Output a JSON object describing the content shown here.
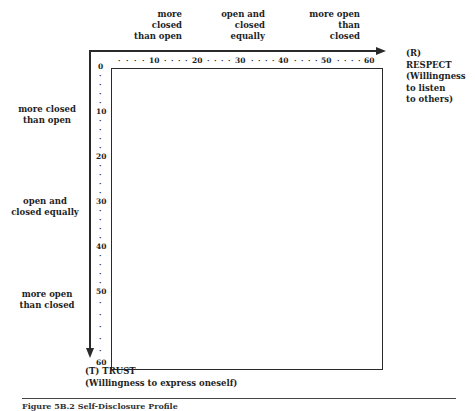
{
  "figure": {
    "top_labels": [
      {
        "lines": [
          "more",
          "closed",
          "than open"
        ]
      },
      {
        "lines": [
          "open and",
          "closed",
          "equally"
        ]
      },
      {
        "lines": [
          "more open",
          "than",
          "closed"
        ]
      }
    ],
    "left_labels": [
      {
        "lines": [
          "more closed",
          "than open"
        ]
      },
      {
        "lines": [
          "open and",
          "closed equally"
        ]
      },
      {
        "lines": [
          "more open",
          "than closed"
        ]
      }
    ],
    "x_axis": {
      "code": "(R)",
      "name": "RESPECT",
      "description_lines": [
        "(Willingness",
        "to listen",
        "to others)"
      ],
      "ticks": [
        "10",
        "20",
        "30",
        "40",
        "50",
        "60"
      ]
    },
    "y_axis": {
      "code_name": "(T) TRUST",
      "description": "(Willingness to express oneself)",
      "ticks": [
        "0",
        "10",
        "20",
        "30",
        "40",
        "50",
        "60"
      ]
    },
    "caption": "Figure 5B.2   Self-Disclosure Profile"
  }
}
